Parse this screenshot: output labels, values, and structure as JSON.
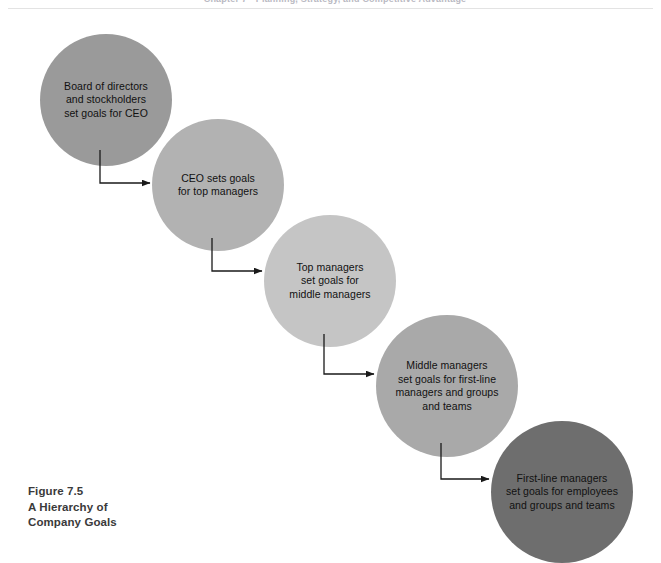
{
  "page": {
    "running_head": "Chapter 7  •  Planning, Strategy, and Competitive Advantage"
  },
  "figure": {
    "caption_lines": [
      "Figure 7.5",
      "A Hierarchy of",
      "Company Goals"
    ],
    "nodes": [
      {
        "id": "board-of-directors",
        "label": "Board of directors\nand stockholders\nset goals for CEO",
        "color": "#9a9a9a",
        "cx": 106,
        "cy": 100,
        "r": 66
      },
      {
        "id": "ceo",
        "label": "CEO sets goals\nfor top managers",
        "color": "#b2b2b2",
        "cx": 218,
        "cy": 185,
        "r": 66
      },
      {
        "id": "top-managers",
        "label": "Top managers\nset goals for\nmiddle managers",
        "color": "#c5c5c5",
        "cx": 330,
        "cy": 281,
        "r": 66
      },
      {
        "id": "middle-managers",
        "label": "Middle managers\nset goals for first-line\nmanagers and groups\nand teams",
        "color": "#a9a9a9",
        "cx": 447,
        "cy": 386,
        "r": 71
      },
      {
        "id": "first-line-managers",
        "label": "First-line managers\nset goals for employees\nand groups and teams",
        "color": "#6e6e6e",
        "cx": 562,
        "cy": 492,
        "r": 71
      }
    ],
    "connectors": [
      {
        "id": "board-to-ceo",
        "from": "board-of-directors",
        "to": "ceo",
        "x1": 100,
        "y1": 150,
        "ybend": 183,
        "x2": 150
      },
      {
        "id": "ceo-to-top-managers",
        "from": "ceo",
        "to": "top-managers",
        "x1": 212,
        "y1": 238,
        "ybend": 271,
        "x2": 262
      },
      {
        "id": "top-managers-to-middle-managers",
        "from": "top-managers",
        "to": "middle-managers",
        "x1": 324,
        "y1": 334,
        "ybend": 374,
        "x2": 374
      },
      {
        "id": "middle-managers-to-first-line",
        "from": "middle-managers",
        "to": "first-line-managers",
        "x1": 441,
        "y1": 443,
        "ybend": 479,
        "x2": 489
      }
    ],
    "colors": {
      "connector_line": "#1a1a1a",
      "background": "#ffffff",
      "caption_text": "#3a3a3a"
    }
  }
}
